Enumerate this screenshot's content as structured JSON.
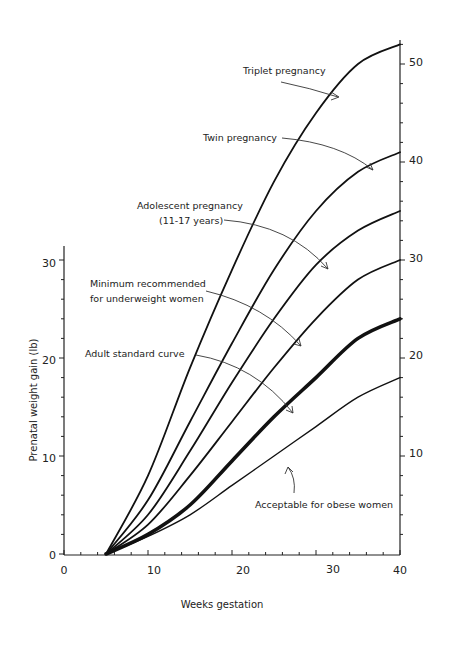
{
  "chart_data": {
    "type": "line",
    "title": "",
    "xlabel": "Weeks gestation",
    "ylabel": "Prenatal weight gain (lb)",
    "xlim": [
      0,
      40
    ],
    "ylim_left": [
      0,
      32
    ],
    "ylim_right": [
      0,
      52
    ],
    "x_ticks": [
      0,
      10,
      20,
      30,
      40
    ],
    "y_ticks_left": [
      0,
      10,
      20,
      30
    ],
    "y_ticks_right": [
      10,
      20,
      30,
      40,
      50
    ],
    "grid": false,
    "legend": "inline annotations with arrows",
    "x": [
      5,
      10,
      15,
      20,
      25,
      30,
      35,
      40
    ],
    "series": [
      {
        "name": "Triplet pregnancy",
        "values": [
          0,
          8,
          19,
          29,
          38,
          45,
          50,
          52
        ],
        "line_width": 1.8
      },
      {
        "name": "Twin pregnancy",
        "values": [
          0,
          5.5,
          13.5,
          21.5,
          29,
          35,
          39,
          41
        ],
        "line_width": 1.8
      },
      {
        "name": "Adolescent pregnancy (11-17 years)",
        "values": [
          0,
          4,
          10.5,
          17.5,
          24,
          29.5,
          33,
          35
        ],
        "line_width": 1.8
      },
      {
        "name": "Minimum recommended for underweight women",
        "values": [
          0,
          3,
          8,
          13.5,
          19,
          24,
          28,
          30
        ],
        "line_width": 1.8
      },
      {
        "name": "Adult standard curve",
        "values": [
          0,
          2,
          5,
          9.5,
          14,
          18,
          22,
          24
        ],
        "line_width": 3.6
      },
      {
        "name": "Acceptable for obese women",
        "values": [
          0,
          1.8,
          4,
          7,
          10,
          13,
          16,
          18
        ],
        "line_width": 1.4
      }
    ],
    "annotations": [
      {
        "text": "Triplet pregnancy",
        "lines": [
          "Triplet pregnancy"
        ]
      },
      {
        "text": "Twin pregnancy",
        "lines": [
          "Twin pregnancy"
        ]
      },
      {
        "text": "Adolescent pregnancy (11-17 years)",
        "lines": [
          "Adolescent pregnancy",
          "(11-17 years)"
        ]
      },
      {
        "text": "Minimum recommended for underweight women",
        "lines": [
          "Minimum recommended",
          "for underweight women"
        ]
      },
      {
        "text": "Adult standard curve",
        "lines": [
          "Adult standard curve"
        ]
      },
      {
        "text": "Acceptable for obese women",
        "lines": [
          "Acceptable for obese women"
        ]
      }
    ]
  },
  "labels": {
    "xlabel": "Weeks gestation",
    "ylabel": "Prenatal weight gain (lb)",
    "x_ticks": [
      "0",
      "10",
      "20",
      "30",
      "40"
    ],
    "y_left_ticks": [
      "0",
      "10",
      "20",
      "30"
    ],
    "y_right_ticks": [
      "10",
      "20",
      "30",
      "40",
      "50"
    ],
    "anno_triplet": "Triplet pregnancy",
    "anno_twin": "Twin pregnancy",
    "anno_adolescent_1": "Adolescent pregnancy",
    "anno_adolescent_2": "(11-17 years)",
    "anno_underweight_1": "Minimum recommended",
    "anno_underweight_2": "for underweight women",
    "anno_adult": "Adult standard curve",
    "anno_obese": "Acceptable for obese women"
  },
  "colors": {
    "line": "#111111",
    "text": "#222222",
    "background": "#ffffff"
  }
}
